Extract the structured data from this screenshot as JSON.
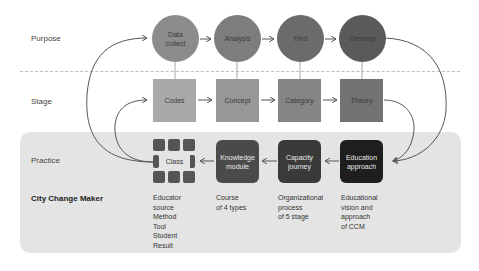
{
  "rows": {
    "purpose": "Purpose",
    "stage": "Stage",
    "practice": "Practice",
    "title": "City Change Maker"
  },
  "purpose_nodes": [
    {
      "line1": "Data",
      "line2": "collect",
      "color": "#8c8c8c"
    },
    {
      "line1": "Analysis",
      "line2": "",
      "color": "#7d7d7d"
    },
    {
      "line1": "Find",
      "line2": "",
      "color": "#6b6b6b"
    },
    {
      "line1": "Develop",
      "line2": "",
      "color": "#5a5a5a"
    }
  ],
  "stage_nodes": [
    {
      "label": "Codes",
      "color": "#a9a9a9"
    },
    {
      "label": "Concept",
      "color": "#979797"
    },
    {
      "label": "Category",
      "color": "#858585"
    },
    {
      "label": "Theory",
      "color": "#727272"
    }
  ],
  "practice_nodes": [
    {
      "label": "Class",
      "color": "#555555"
    },
    {
      "line1": "Knowledge",
      "line2": "module",
      "color": "#4a4a4a"
    },
    {
      "line1": "Capacity",
      "line2": "journey",
      "color": "#3a3a3a"
    },
    {
      "line1": "Education",
      "line2": "approach",
      "color": "#1e1e1e"
    }
  ],
  "descriptions": [
    [
      "Educator",
      "source",
      "Method",
      "Tool",
      "Student",
      "Result"
    ],
    [
      "Course",
      "of 4 types"
    ],
    [
      "Organizational",
      "process",
      "of 5 stage"
    ],
    [
      "Educational",
      "vision and",
      "approach",
      "of CCM"
    ]
  ]
}
